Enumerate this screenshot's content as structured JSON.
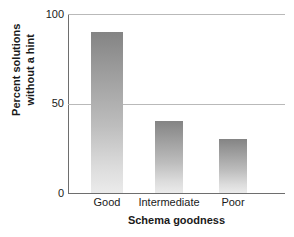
{
  "chart_data": {
    "type": "bar",
    "title": "",
    "categories": [
      "Good",
      "Intermediate",
      "Poor"
    ],
    "values": [
      90,
      40,
      30
    ],
    "series": [
      {
        "name": "Percent solutions without a hint",
        "values": [
          90,
          40,
          30
        ]
      }
    ],
    "xlabel": "Schema goodness",
    "ylabel": "Percent solutions without a hint",
    "ylabel_lines": [
      "Percent solutions",
      "without a hint"
    ],
    "ylim": [
      0,
      100
    ],
    "yticks": [
      "0",
      "50",
      "100"
    ],
    "ytick_values": [
      0,
      50,
      100
    ],
    "grid": "horizontal",
    "legend": "none",
    "bar_fill": "#9a9a9a",
    "bar_fill_top": "#848484",
    "bar_fill_bottom": "#ebebeb",
    "axis_color": "#6e6e6e",
    "gridline_color": "#b9b9b9",
    "background": "#ffffff"
  },
  "axes": {
    "y": {
      "tick_top": "100",
      "tick_mid": "50",
      "tick_bottom": "0"
    },
    "x": {
      "tick_0": "Good",
      "tick_1": "Intermediate",
      "tick_2": "Poor",
      "title": "Schema goodness"
    },
    "ylabel_line_1": "Percent solutions",
    "ylabel_line_2": "without a hint"
  }
}
